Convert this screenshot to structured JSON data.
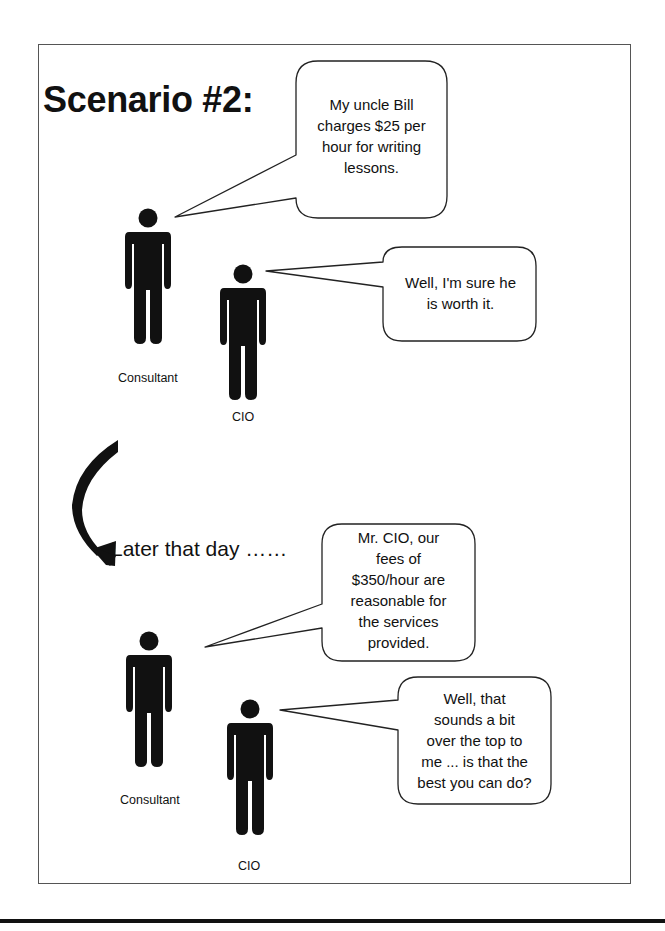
{
  "title": "Scenario #2:",
  "transition_text": "Later that day ……",
  "scene1": {
    "characters": [
      {
        "role": "Consultant",
        "label": "Consultant"
      },
      {
        "role": "CIO",
        "label": "CIO"
      }
    ],
    "dialogue": [
      {
        "speaker": "Consultant",
        "lines": [
          "My uncle Bill",
          "charges $25 per",
          "hour for writing",
          "lessons."
        ]
      },
      {
        "speaker": "CIO",
        "lines": [
          "Well, I'm sure he",
          "is worth it."
        ]
      }
    ]
  },
  "scene2": {
    "characters": [
      {
        "role": "Consultant",
        "label": "Consultant"
      },
      {
        "role": "CIO",
        "label": "CIO"
      }
    ],
    "dialogue": [
      {
        "speaker": "Consultant",
        "lines": [
          "Mr. CIO, our",
          "fees of",
          "$350/hour are",
          "reasonable for",
          "the services",
          "provided."
        ]
      },
      {
        "speaker": "CIO",
        "lines": [
          "Well, that",
          "sounds a bit",
          "over the top to",
          "me ... is that the",
          "best you can do?"
        ]
      }
    ]
  },
  "icons": {
    "person": "person-silhouette-icon",
    "arrow": "curved-arrow-icon"
  },
  "colors": {
    "ink": "#111111",
    "frame": "#555555",
    "background": "#ffffff"
  }
}
